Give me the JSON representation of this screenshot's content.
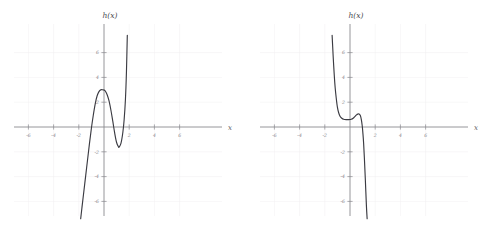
{
  "figure": {
    "background_color": "#ffffff",
    "curve_color": "#3b3b42",
    "axis_color": "#8a8a8f",
    "grid_color": "#f0eef0",
    "label_color": "#88888e"
  },
  "panels": [
    {
      "id": "left",
      "title": "h(x)",
      "xlabel": "x"
    },
    {
      "id": "right",
      "title": "h(x)",
      "xlabel": "x"
    }
  ],
  "chart_data": [
    {
      "type": "line",
      "title": "h(x)",
      "xlabel": "x",
      "ylabel": "h(x)",
      "xlim": [
        -7,
        7
      ],
      "ylim": [
        -7.5,
        7.5
      ],
      "grid": true,
      "legend": "none",
      "xticks": [
        -6,
        -4,
        -2,
        2,
        4,
        6
      ],
      "xticklabels": [
        "-6",
        "-4",
        "-2",
        "2",
        "4",
        "6"
      ],
      "yticks": [
        -6,
        -4,
        -2,
        2,
        4,
        6
      ],
      "yticklabels": [
        "-6",
        "-4",
        "-2",
        "2",
        "4",
        "6"
      ],
      "description": "Cubic-like curve rising from lower left, local maximum near (0, 3), local minimum near (1.2, -1.6), then rising steeply off the top near x = 1.85",
      "features": {
        "local_maximum": [
          0.0,
          3.0
        ],
        "local_minimum": [
          1.2,
          -1.6
        ],
        "x_intercepts": [
          -1.2,
          0.65,
          1.7
        ]
      },
      "x": [
        -1.85,
        -1.75,
        -1.6,
        -1.45,
        -1.3,
        -1.15,
        -1.0,
        -0.85,
        -0.7,
        -0.55,
        -0.4,
        -0.25,
        -0.1,
        0.0,
        0.1,
        0.25,
        0.4,
        0.55,
        0.7,
        0.85,
        1.0,
        1.15,
        1.2,
        1.35,
        1.5,
        1.6,
        1.7,
        1.78,
        1.85
      ],
      "y": [
        -7.4,
        -6.5,
        -5.2,
        -3.9,
        -2.6,
        -1.3,
        -0.1,
        0.95,
        1.85,
        2.5,
        2.85,
        3.0,
        3.0,
        2.98,
        2.9,
        2.6,
        2.1,
        1.35,
        0.45,
        -0.5,
        -1.25,
        -1.6,
        -1.62,
        -1.3,
        -0.4,
        0.6,
        2.2,
        4.4,
        7.4
      ]
    },
    {
      "type": "line",
      "title": "h(x)",
      "xlabel": "x",
      "ylabel": "h(x)",
      "xlim": [
        -7,
        7
      ],
      "ylim": [
        -7.5,
        7.5
      ],
      "grid": true,
      "legend": "none",
      "xticks": [
        -6,
        -4,
        -2,
        2,
        4,
        6
      ],
      "xticklabels": [
        "-6",
        "-4",
        "-2",
        "2",
        "4",
        "6"
      ],
      "yticks": [
        -6,
        -4,
        -2,
        2,
        4,
        6
      ],
      "yticklabels": [
        "-6",
        "-4",
        "-2",
        "2",
        "4",
        "6"
      ],
      "description": "Curve descending steeply from upper left, flattening to a plateau near y = 0.6 between x = -1 and x = 0.5, a small bump near x = 0.7, then plunging steeply through the x-axis near x = 1.05",
      "features": {
        "plateau_level": 0.6,
        "bump_peak": [
          0.72,
          1.05
        ],
        "x_intercepts": [
          1.05
        ]
      },
      "x": [
        -1.42,
        -1.38,
        -1.32,
        -1.25,
        -1.18,
        -1.1,
        -1.0,
        -0.9,
        -0.78,
        -0.65,
        -0.5,
        -0.35,
        -0.2,
        -0.05,
        0.1,
        0.25,
        0.4,
        0.52,
        0.62,
        0.72,
        0.82,
        0.9,
        0.97,
        1.02,
        1.08,
        1.15,
        1.22,
        1.3,
        1.36
      ],
      "y": [
        7.4,
        6.6,
        5.4,
        4.2,
        3.2,
        2.4,
        1.6,
        1.15,
        0.85,
        0.7,
        0.62,
        0.6,
        0.6,
        0.6,
        0.62,
        0.7,
        0.85,
        0.98,
        1.04,
        1.05,
        0.92,
        0.6,
        0.1,
        -0.45,
        -1.3,
        -2.7,
        -4.3,
        -6.3,
        -7.4
      ]
    }
  ]
}
